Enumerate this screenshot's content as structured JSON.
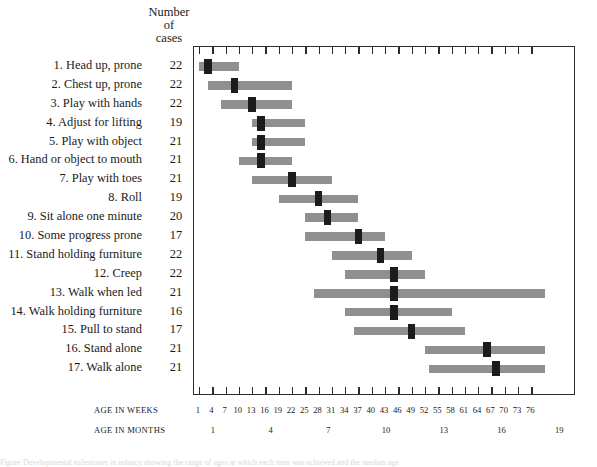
{
  "header": {
    "cases_line1": "Number",
    "cases_line2": "of",
    "cases_line3": "cases"
  },
  "axes": {
    "weeks_caption": "AGE IN WEEKS",
    "months_caption": "AGE IN MONTHS",
    "weeks_ticks": [
      1,
      4,
      7,
      10,
      13,
      16,
      19,
      22,
      25,
      28,
      31,
      34,
      37,
      40,
      43,
      46,
      49,
      52,
      55,
      58,
      61,
      64,
      67,
      70,
      73,
      76
    ],
    "months_ticks": [
      1,
      4,
      7,
      10,
      13,
      16,
      19
    ]
  },
  "colors": {
    "bar_range": "#8f8f8f",
    "bar_median": "#1c1c1c",
    "frame": "#2b2b2b",
    "text": "#1a1a1a",
    "background": "#ffffff"
  },
  "caption_strip": "Figure  Developmental milestones in infancy showing the range of ages at which each item was achieved and the median age",
  "chart_data": {
    "type": "bar",
    "subtype": "range-with-median (floating horizontal bars)",
    "title": "",
    "xlabel": "AGE IN WEEKS",
    "ylabel": "",
    "xlim": [
      0,
      79
    ],
    "grid": false,
    "legend": "none",
    "x_axis_secondary": {
      "label": "AGE IN MONTHS",
      "ticks": [
        1,
        4,
        7,
        10,
        13,
        16,
        19
      ],
      "weeks_per_month": 4.345
    },
    "columns": [
      "item",
      "number_of_cases",
      "range_start_weeks",
      "range_end_weeks",
      "median_weeks"
    ],
    "categories": [
      "1. Head up, prone",
      "2. Chest up, prone",
      "3. Play with hands",
      "4. Adjust for lifting",
      "5. Play with object",
      "6. Hand or object to mouth",
      "7. Play with toes",
      "8. Roll",
      "9. Sit alone one minute",
      "10. Some progress prone",
      "11. Stand holding furniture",
      "12. Creep",
      "13. Walk when led",
      "14. Walk holding furniture",
      "15. Pull to stand",
      "16. Stand alone",
      "17. Walk alone"
    ],
    "rows": [
      {
        "item": "1. Head up, prone",
        "number_of_cases": 22,
        "range_start_weeks": 1,
        "range_end_weeks": 10,
        "median_weeks": 3
      },
      {
        "item": "2. Chest up, prone",
        "number_of_cases": 22,
        "range_start_weeks": 3,
        "range_end_weeks": 22,
        "median_weeks": 9
      },
      {
        "item": "3. Play with hands",
        "number_of_cases": 22,
        "range_start_weeks": 6,
        "range_end_weeks": 22,
        "median_weeks": 13
      },
      {
        "item": "4. Adjust for lifting",
        "number_of_cases": 19,
        "range_start_weeks": 13,
        "range_end_weeks": 25,
        "median_weeks": 15
      },
      {
        "item": "5. Play with object",
        "number_of_cases": 21,
        "range_start_weeks": 13,
        "range_end_weeks": 25,
        "median_weeks": 15
      },
      {
        "item": "6. Hand or object to mouth",
        "number_of_cases": 21,
        "range_start_weeks": 10,
        "range_end_weeks": 22,
        "median_weeks": 15
      },
      {
        "item": "7. Play with toes",
        "number_of_cases": 21,
        "range_start_weeks": 13,
        "range_end_weeks": 31,
        "median_weeks": 22
      },
      {
        "item": "8. Roll",
        "number_of_cases": 19,
        "range_start_weeks": 19,
        "range_end_weeks": 37,
        "median_weeks": 28
      },
      {
        "item": "9. Sit alone one minute",
        "number_of_cases": 20,
        "range_start_weeks": 25,
        "range_end_weeks": 37,
        "median_weeks": 30
      },
      {
        "item": "10. Some progress prone",
        "number_of_cases": 17,
        "range_start_weeks": 25,
        "range_end_weeks": 43,
        "median_weeks": 37
      },
      {
        "item": "11. Stand holding furniture",
        "number_of_cases": 22,
        "range_start_weeks": 31,
        "range_end_weeks": 49,
        "median_weeks": 42
      },
      {
        "item": "12. Creep",
        "number_of_cases": 22,
        "range_start_weeks": 34,
        "range_end_weeks": 52,
        "median_weeks": 45
      },
      {
        "item": "13. Walk when led",
        "number_of_cases": 21,
        "range_start_weeks": 27,
        "range_end_weeks": 79,
        "median_weeks": 45
      },
      {
        "item": "14. Walk holding furniture",
        "number_of_cases": 16,
        "range_start_weeks": 34,
        "range_end_weeks": 58,
        "median_weeks": 45
      },
      {
        "item": "15. Pull to stand",
        "number_of_cases": 17,
        "range_start_weeks": 36,
        "range_end_weeks": 61,
        "median_weeks": 49
      },
      {
        "item": "16. Stand alone",
        "number_of_cases": 21,
        "range_start_weeks": 52,
        "range_end_weeks": 79,
        "median_weeks": 66
      },
      {
        "item": "17. Walk alone",
        "number_of_cases": 21,
        "range_start_weeks": 53,
        "range_end_weeks": 79,
        "median_weeks": 68
      }
    ]
  }
}
